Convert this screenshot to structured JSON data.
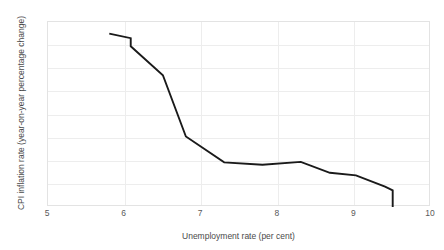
{
  "chart_data": {
    "type": "line",
    "title": "",
    "xlabel": "Unemployment rate (per cent)",
    "ylabel": "CPI inflation rate (year-on-year percentage change)",
    "xlim": [
      5,
      10
    ],
    "ylim": [
      -2,
      6
    ],
    "xticks": [
      "5",
      "6",
      "7",
      "8",
      "9",
      "10"
    ],
    "yticks": [
      "6",
      "5",
      "4",
      "3",
      "2",
      "1",
      "0",
      "-1",
      "-2"
    ],
    "grid": true,
    "legend": "none",
    "line_color": "#1a1a1a",
    "grid_color": "#ededed",
    "x": [
      5.8,
      6.08,
      6.08,
      6.5,
      6.8,
      7.3,
      7.8,
      8.3,
      8.68,
      9.02,
      9.4,
      9.5,
      9.5
    ],
    "y": [
      5.5,
      5.3,
      4.95,
      3.7,
      1.05,
      -0.07,
      -0.17,
      -0.05,
      -0.52,
      -0.63,
      -1.12,
      -1.28,
      -2.0
    ],
    "points": [
      {
        "x": 5.8,
        "y": 5.5
      },
      {
        "x": 6.08,
        "y": 5.3
      },
      {
        "x": 6.08,
        "y": 4.95
      },
      {
        "x": 6.5,
        "y": 3.7
      },
      {
        "x": 6.8,
        "y": 1.05
      },
      {
        "x": 7.3,
        "y": -0.07
      },
      {
        "x": 7.8,
        "y": -0.17
      },
      {
        "x": 8.3,
        "y": -0.05
      },
      {
        "x": 8.68,
        "y": -0.52
      },
      {
        "x": 9.02,
        "y": -0.63
      },
      {
        "x": 9.4,
        "y": -1.12
      },
      {
        "x": 9.5,
        "y": -1.28
      },
      {
        "x": 9.5,
        "y": -2.0
      }
    ]
  }
}
